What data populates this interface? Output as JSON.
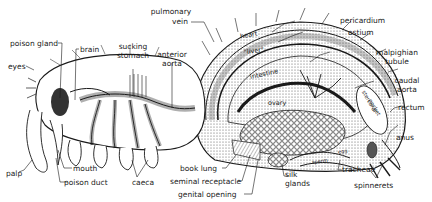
{
  "figure": {
    "labels": {
      "poison_gland": "poison gland",
      "brain": "brain",
      "eyes": "eyes",
      "sucking_stomach_1": "sucking",
      "sucking_stomach_2": "stomach",
      "anterior_aorta_1": "anterior",
      "anterior_aorta_2": "aorta",
      "pulmonary_vein_1": "pulmonary",
      "pulmonary_vein_2": "vein",
      "pericardium": "pericardium",
      "ostium": "ostium",
      "malpighian_tubule_1": "malpighian",
      "malpighian_tubule_2": "tubule",
      "caudal_aorta_1": "caudal",
      "caudal_aorta_2": "aorta",
      "rectum": "rectum",
      "anus": "anus",
      "palp": "palp",
      "mouth": "mouth",
      "poison_duct": "poison duct",
      "caeca": "caeca",
      "book_lung": "book lung",
      "seminal_receptacle": "seminal receptacle",
      "genital_opening": "genital opening",
      "silk_glands_1": "silk",
      "silk_glands_2": "glands",
      "tracheae": "tracheae",
      "spinnerets": "spinnerets"
    },
    "inner_labels": {
      "heart": "heart",
      "liver": "\"liver\"",
      "intestine": "intestine",
      "ovary": "ovary",
      "stercoral_pocket_1": "stercoral",
      "stercoral_pocket_2": "pocket",
      "egg": "egg",
      "sperm": "sperm"
    },
    "colors": {
      "ink": "#1a1a1a",
      "background": "#ffffff",
      "shade": "#bdbdbd",
      "light_shade": "#e4e4e4"
    }
  }
}
